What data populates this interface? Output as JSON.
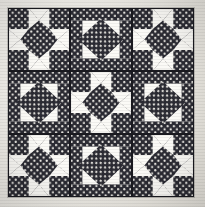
{
  "image": {
    "subject": "patchwork quilt top",
    "pattern_name": "Shoo Fly",
    "alt_block_name": "Square on Point",
    "grid_rows": 3,
    "grid_cols": 3,
    "background_color": "#efece6"
  },
  "fabrics": {
    "dark_label": "navy polka dot",
    "dark_color": "#2b2b33",
    "dot_color": "#f2f0ea",
    "light_label": "off white solid",
    "light_color": "#fbfaf6",
    "seam_color": "#1a1a20"
  },
  "blocks": [
    {
      "position": "top-left",
      "type": "shoofly"
    },
    {
      "position": "top-center",
      "type": "onpoint"
    },
    {
      "position": "top-right",
      "type": "shoofly"
    },
    {
      "position": "middle-left",
      "type": "onpoint"
    },
    {
      "position": "middle-center",
      "type": "shoofly"
    },
    {
      "position": "middle-right",
      "type": "onpoint"
    },
    {
      "position": "bottom-left",
      "type": "shoofly"
    },
    {
      "position": "bottom-center",
      "type": "onpoint"
    },
    {
      "position": "bottom-right",
      "type": "shoofly"
    }
  ]
}
